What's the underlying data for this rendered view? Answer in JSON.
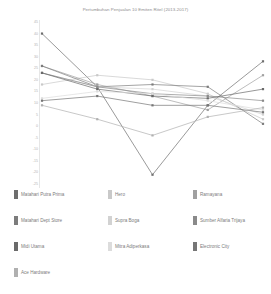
{
  "chart_data": {
    "type": "line",
    "title": "Pertumbuhan Penjualan 10 Emiten Ritel (2013-2017)",
    "xlabel": "",
    "ylabel": "",
    "grid": false,
    "legend_position": "bottom",
    "x": [
      "2013",
      "2014",
      "2015",
      "2016",
      "2017"
    ],
    "ylim": [
      -25,
      45
    ],
    "yticks": [
      45,
      40,
      35,
      30,
      25,
      20,
      15,
      10,
      5,
      0,
      -5,
      -10,
      -15,
      -20,
      -25
    ],
    "ytick_labels": [
      "45",
      "40",
      "35",
      "30",
      "25",
      "20",
      "15",
      "10",
      "5",
      "0",
      "-5",
      "-10",
      "-15",
      "-20",
      "-25"
    ],
    "series": [
      {
        "name": "Matahari Putra Prima",
        "color": "#6e6e6e",
        "values": [
          40,
          17,
          -21,
          9,
          28
        ]
      },
      {
        "name": "Hero",
        "color": "#c9c9c9",
        "values": [
          18,
          22,
          20,
          14,
          3
        ]
      },
      {
        "name": "Ramayana",
        "color": "#a0a0a0",
        "values": [
          26,
          18,
          13,
          7,
          22
        ]
      },
      {
        "name": "Matahari Dept Store",
        "color": "#7c7c7c",
        "values": [
          26,
          17,
          18,
          17,
          1
        ]
      },
      {
        "name": "Supra Boga",
        "color": "#d2d2d2",
        "values": [
          23,
          17,
          16,
          13,
          5
        ]
      },
      {
        "name": "Sumber Alfaria Trijaya",
        "color": "#8a8a8a",
        "values": [
          23,
          17,
          14,
          13,
          11
        ]
      },
      {
        "name": "Midi Utama",
        "color": "#6a6a6a",
        "values": [
          23,
          16,
          13,
          12,
          16
        ]
      },
      {
        "name": "Mitra Adiperkasa",
        "color": "#dcdcdc",
        "values": [
          12,
          15,
          14,
          11,
          7
        ]
      },
      {
        "name": "Electronic City",
        "color": "#767676",
        "values": [
          11,
          13,
          9,
          9,
          6
        ]
      },
      {
        "name": "Ace Hardware",
        "color": "#b0b0b0",
        "values": [
          9,
          3,
          -4,
          4,
          8
        ]
      }
    ]
  },
  "legend": {
    "rows": [
      [
        "Matahari Putra Prima",
        "Hero",
        "Ramayana"
      ],
      [
        "Matahari Dept Store",
        "Supra Boga",
        "Sumber Alfaria Trijaya"
      ],
      [
        "Midi Utama",
        "Mitra Adiperkasa",
        "Electronic City"
      ],
      [
        "Ace Hardware"
      ]
    ]
  }
}
